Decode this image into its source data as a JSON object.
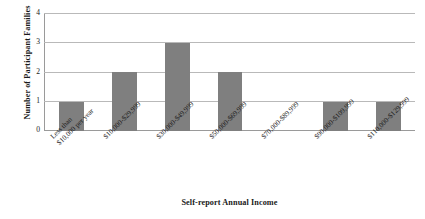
{
  "chart_data": {
    "type": "bar",
    "title": "",
    "categories": [
      "Less than $10,000 per year",
      "$10,000-$29,999",
      "$30,000-$49,999",
      "$50,000-$69,999",
      "$70,000-$89,999",
      "$90,000-$109,999",
      "$110,000-$129,999"
    ],
    "category_lines": [
      [
        "Less than",
        "$10,000 per year"
      ],
      [
        "$10,000-$29,999",
        ""
      ],
      [
        "$30,000-$49,999",
        ""
      ],
      [
        "$50,000-$69,999",
        ""
      ],
      [
        "$70,000-$89,999",
        ""
      ],
      [
        "$90,000-$109,999",
        ""
      ],
      [
        "$110,000-$129,999",
        ""
      ]
    ],
    "values": [
      1,
      2,
      3,
      2,
      0,
      1,
      1
    ],
    "xlabel": "Self-report Annual Income",
    "ylabel": "Number of Participant Families",
    "ylim": [
      0,
      4
    ],
    "ytick_labels": [
      "4",
      "3",
      "2",
      "1",
      "0"
    ],
    "ytick_values": [
      4,
      3,
      2,
      1,
      0
    ],
    "grid": true,
    "legend": false,
    "bar_color": "#7f7f7f",
    "gridline_color": "#b9b9b9",
    "axis_color": "#9a9a9a",
    "background_color": "#ffffff"
  }
}
